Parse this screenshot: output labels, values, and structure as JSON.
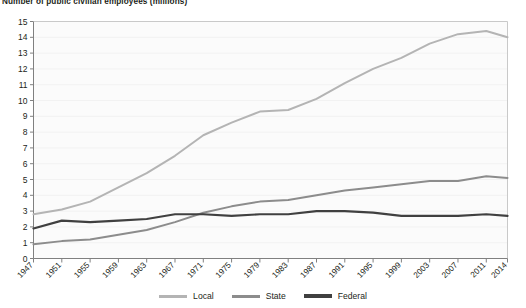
{
  "chart_title": "Number of public civilian employees (millions)",
  "axes": {
    "y_ticks": [
      "0",
      "1",
      "2",
      "3",
      "4",
      "5",
      "6",
      "7",
      "8",
      "9",
      "10",
      "11",
      "12",
      "13",
      "14",
      "15"
    ],
    "x_ticks": [
      "1947",
      "1951",
      "1955",
      "1959",
      "1963",
      "1967",
      "1971",
      "1975",
      "1979",
      "1983",
      "1987",
      "1991",
      "1995",
      "1999",
      "2003",
      "2007",
      "2011",
      "2014"
    ]
  },
  "legend": {
    "items": [
      {
        "label": "Local",
        "color": "#b4b4b4"
      },
      {
        "label": "State",
        "color": "#8c8c8c"
      },
      {
        "label": "Federal",
        "color": "#404040"
      }
    ]
  },
  "colors": {
    "local": "#b4b4b4",
    "state": "#8c8c8c",
    "federal": "#404040",
    "axis": "#808080",
    "plot_background": "#fbfbfb",
    "text": "#231f20"
  },
  "chart_data": {
    "type": "line",
    "title": "Number of public civilian employees (millions)",
    "xlabel": "",
    "ylabel": "Number of public civilian employees (millions)",
    "xlim": [
      1947,
      2014
    ],
    "ylim": [
      0,
      15
    ],
    "grid": false,
    "legend_position": "bottom",
    "x": [
      1947,
      1951,
      1955,
      1959,
      1963,
      1967,
      1971,
      1975,
      1979,
      1983,
      1987,
      1991,
      1995,
      1999,
      2003,
      2007,
      2011,
      2014
    ],
    "x_tick_labels": [
      "1947",
      "1951",
      "1955",
      "1959",
      "1963",
      "1967",
      "1971",
      "1975",
      "1979",
      "1983",
      "1987",
      "1991",
      "1995",
      "1999",
      "2003",
      "2007",
      "2011",
      "2014"
    ],
    "y_tick_labels": [
      "0",
      "1",
      "2",
      "3",
      "4",
      "5",
      "6",
      "7",
      "8",
      "9",
      "10",
      "11",
      "12",
      "13",
      "14",
      "15"
    ],
    "series": [
      {
        "name": "Local",
        "color": "#b4b4b4",
        "values": [
          2.8,
          3.1,
          3.6,
          4.5,
          5.4,
          6.5,
          7.8,
          8.6,
          9.3,
          9.4,
          10.1,
          11.1,
          12.0,
          12.7,
          13.6,
          14.2,
          14.4,
          14.0
        ]
      },
      {
        "name": "State",
        "color": "#8c8c8c",
        "values": [
          0.9,
          1.1,
          1.2,
          1.5,
          1.8,
          2.3,
          2.9,
          3.3,
          3.6,
          3.7,
          4.0,
          4.3,
          4.5,
          4.7,
          4.9,
          4.9,
          5.2,
          5.1
        ]
      },
      {
        "name": "Federal",
        "color": "#404040",
        "values": [
          1.9,
          2.4,
          2.3,
          2.4,
          2.5,
          2.8,
          2.8,
          2.7,
          2.8,
          2.8,
          3.0,
          3.0,
          2.9,
          2.7,
          2.7,
          2.7,
          2.8,
          2.7
        ]
      }
    ]
  }
}
